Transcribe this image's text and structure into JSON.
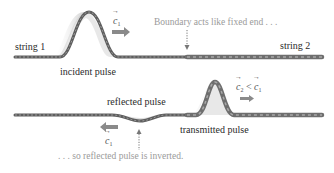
{
  "diagram": {
    "top_panel": {
      "string_left_label": "string 1",
      "string_right_label": "string 2",
      "pulse_label": "incident pulse",
      "velocity_label": "c",
      "velocity_subscript": "1",
      "annotation": "Boundary acts like fixed end . . ."
    },
    "bottom_panel": {
      "reflected_label": "reflected pulse",
      "transmitted_label": "transmitted pulse",
      "reflected_velocity_label": "c",
      "reflected_velocity_subscript": "1",
      "comparison_left": "c",
      "comparison_left_subscript": "2",
      "comparison_operator": "<",
      "comparison_right": "c",
      "comparison_right_subscript": "1",
      "annotation": ". . . so reflected pulse is inverted."
    },
    "colors": {
      "string": "#6e6e6e",
      "string_dark": "#4a4a4a",
      "arrow": "#8a8a8a",
      "annotation_text": "#9a9a9a",
      "label_text": "#2a2a2a"
    }
  }
}
